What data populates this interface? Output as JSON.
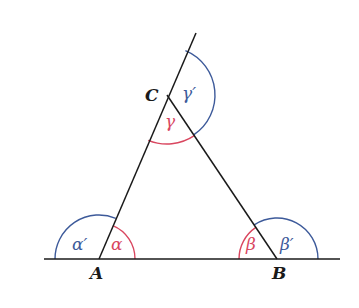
{
  "figure": {
    "colors": {
      "line": "#1a1a1a",
      "interior": "#d9465f",
      "exterior": "#3d5a9a",
      "background": "#ffffff"
    },
    "vertices": {
      "A": {
        "label": "A",
        "x": 99,
        "y": 259
      },
      "B": {
        "label": "B",
        "x": 277,
        "y": 259
      },
      "C": {
        "label": "C",
        "x": 167,
        "y": 95
      }
    },
    "angles": {
      "alpha": {
        "label": "α",
        "kind": "interior",
        "vertex": "A"
      },
      "alpha_prime": {
        "label": "α′",
        "kind": "exterior",
        "vertex": "A"
      },
      "beta": {
        "label": "β",
        "kind": "interior",
        "vertex": "B"
      },
      "beta_prime": {
        "label": "β′",
        "kind": "exterior",
        "vertex": "B"
      },
      "gamma": {
        "label": "γ",
        "kind": "interior",
        "vertex": "C"
      },
      "gamma_prime": {
        "label": "γ′",
        "kind": "exterior",
        "vertex": "C"
      }
    }
  }
}
